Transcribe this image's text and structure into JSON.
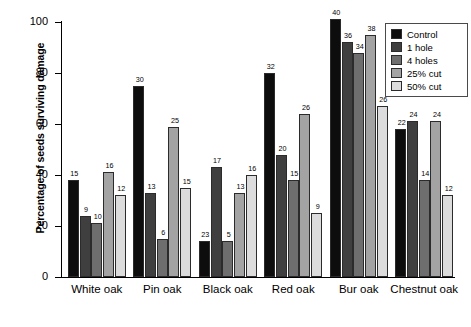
{
  "chart_data": {
    "type": "bar",
    "title": "",
    "xlabel": "",
    "ylabel": "Percentage of seeds surviving damage",
    "ylim": [
      0,
      100
    ],
    "yticks": [
      0,
      20,
      40,
      60,
      80,
      100
    ],
    "grid": false,
    "legend_position": "top-right",
    "categories": [
      "White oak",
      "Pin oak",
      "Black oak",
      "Red oak",
      "Bur oak",
      "Chestnut oak"
    ],
    "series": [
      {
        "name": "Control",
        "color": "#0d0d0d",
        "values": [
          38,
          75,
          14,
          80,
          101,
          58
        ],
        "point_labels": [
          15,
          30,
          23,
          32,
          40,
          22
        ]
      },
      {
        "name": "1 hole",
        "color": "#3f3f3f",
        "values": [
          24,
          33,
          43,
          48,
          92,
          61
        ],
        "point_labels": [
          9,
          13,
          17,
          20,
          36,
          24
        ]
      },
      {
        "name": "4 holes",
        "color": "#6e6e6e",
        "values": [
          21,
          15,
          14,
          38,
          88,
          38
        ],
        "point_labels": [
          10,
          6,
          5,
          15,
          34,
          14
        ]
      },
      {
        "name": "25% cut",
        "color": "#a3a3a3",
        "values": [
          41,
          59,
          33,
          64,
          95,
          61
        ],
        "point_labels": [
          16,
          25,
          13,
          26,
          38,
          24
        ]
      },
      {
        "name": "50% cut",
        "color": "#dcdcdc",
        "values": [
          32,
          35,
          40,
          25,
          67,
          32
        ],
        "point_labels": [
          12,
          15,
          16,
          9,
          26,
          12
        ]
      }
    ]
  },
  "legend": {
    "entries": [
      {
        "label": "Control",
        "color": "#0d0d0d"
      },
      {
        "label": "1 hole",
        "color": "#3f3f3f"
      },
      {
        "label": "4 holes",
        "color": "#6e6e6e"
      },
      {
        "label": "25% cut",
        "color": "#a3a3a3"
      },
      {
        "label": "50% cut",
        "color": "#dcdcdc"
      }
    ]
  }
}
